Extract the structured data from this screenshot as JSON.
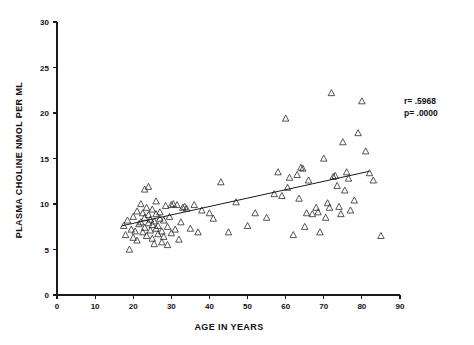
{
  "chart_data": {
    "type": "scatter",
    "title": "",
    "xlabel": "AGE IN YEARS",
    "ylabel": "PLASMA CHOLINE NMOL PER ML",
    "xlim": [
      0,
      90
    ],
    "ylim": [
      0,
      30
    ],
    "xticks": [
      0,
      10,
      20,
      30,
      40,
      50,
      60,
      70,
      80,
      90
    ],
    "yticks": [
      0,
      5,
      10,
      15,
      20,
      25,
      30
    ],
    "xtick_labels": [
      "0",
      "10",
      "20",
      "30",
      "40",
      "50",
      "60",
      "70",
      "80",
      "90"
    ],
    "ytick_labels": [
      "0",
      "5",
      "10",
      "15",
      "20",
      "25",
      "30"
    ],
    "grid": false,
    "legend": null,
    "marker": "triangle-up-open",
    "annotations": [
      {
        "name": "correlation",
        "text": "r= .5968"
      },
      {
        "name": "p-value",
        "text": "p= .0000"
      }
    ],
    "regression_line": {
      "x": [
        17,
        82
      ],
      "y": [
        7.6,
        13.6
      ],
      "slope": 0.0923,
      "intercept": 6.03
    },
    "points": [
      [
        17.5,
        7.6
      ],
      [
        18.0,
        6.6
      ],
      [
        18.5,
        8.2
      ],
      [
        19.0,
        5.0
      ],
      [
        19.5,
        7.2
      ],
      [
        20.0,
        6.3
      ],
      [
        20.0,
        8.6
      ],
      [
        20.5,
        7.0
      ],
      [
        21.0,
        9.2
      ],
      [
        21.0,
        6.0
      ],
      [
        21.5,
        7.8
      ],
      [
        22.0,
        8.0
      ],
      [
        22.0,
        10.0
      ],
      [
        22.5,
        6.9
      ],
      [
        22.5,
        9.0
      ],
      [
        23.0,
        7.4
      ],
      [
        23.0,
        8.5
      ],
      [
        23.0,
        11.6
      ],
      [
        23.5,
        6.5
      ],
      [
        23.5,
        9.6
      ],
      [
        24.0,
        7.9
      ],
      [
        24.0,
        8.8
      ],
      [
        24.0,
        11.9
      ],
      [
        24.5,
        7.1
      ],
      [
        24.5,
        8.3
      ],
      [
        25.0,
        6.2
      ],
      [
        25.0,
        7.7
      ],
      [
        25.0,
        9.4
      ],
      [
        25.5,
        8.1
      ],
      [
        25.5,
        5.6
      ],
      [
        26.0,
        7.3
      ],
      [
        26.0,
        8.9
      ],
      [
        26.0,
        10.3
      ],
      [
        26.5,
        6.7
      ],
      [
        26.5,
        7.6
      ],
      [
        27.0,
        8.4
      ],
      [
        27.0,
        9.1
      ],
      [
        27.5,
        5.8
      ],
      [
        27.5,
        7.0
      ],
      [
        28.0,
        8.2
      ],
      [
        28.0,
        6.4
      ],
      [
        28.5,
        9.8
      ],
      [
        29.0,
        7.5
      ],
      [
        29.0,
        5.5
      ],
      [
        29.5,
        8.6
      ],
      [
        30.0,
        6.8
      ],
      [
        30.0,
        9.9
      ],
      [
        30.5,
        10.0
      ],
      [
        31.0,
        7.2
      ],
      [
        31.5,
        9.9
      ],
      [
        32.0,
        6.1
      ],
      [
        32.5,
        8.0
      ],
      [
        33.0,
        9.6
      ],
      [
        33.5,
        9.7
      ],
      [
        34.0,
        9.5
      ],
      [
        35.0,
        7.3
      ],
      [
        36.0,
        9.9
      ],
      [
        37.0,
        6.9
      ],
      [
        38.0,
        9.3
      ],
      [
        40.0,
        9.0
      ],
      [
        41.0,
        8.4
      ],
      [
        43.0,
        12.4
      ],
      [
        45.0,
        6.9
      ],
      [
        47.0,
        10.2
      ],
      [
        50.0,
        7.6
      ],
      [
        52.0,
        9.0
      ],
      [
        55.0,
        8.5
      ],
      [
        57.0,
        11.1
      ],
      [
        58.0,
        13.5
      ],
      [
        59.0,
        10.9
      ],
      [
        60.0,
        19.4
      ],
      [
        60.5,
        11.8
      ],
      [
        61.0,
        12.9
      ],
      [
        62.0,
        6.6
      ],
      [
        63.0,
        13.2
      ],
      [
        63.5,
        10.6
      ],
      [
        64.0,
        14.0
      ],
      [
        64.5,
        13.9
      ],
      [
        65.0,
        7.5
      ],
      [
        65.5,
        9.0
      ],
      [
        66.0,
        12.6
      ],
      [
        67.0,
        8.9
      ],
      [
        68.0,
        9.6
      ],
      [
        68.5,
        9.1
      ],
      [
        69.0,
        6.9
      ],
      [
        70.0,
        15.0
      ],
      [
        70.5,
        8.5
      ],
      [
        71.0,
        10.1
      ],
      [
        71.5,
        9.6
      ],
      [
        72.0,
        22.2
      ],
      [
        72.5,
        13.0
      ],
      [
        73.0,
        13.1
      ],
      [
        73.5,
        12.0
      ],
      [
        74.0,
        9.7
      ],
      [
        74.5,
        8.9
      ],
      [
        75.0,
        16.8
      ],
      [
        75.5,
        11.5
      ],
      [
        76.0,
        13.5
      ],
      [
        76.5,
        12.8
      ],
      [
        77.0,
        9.3
      ],
      [
        78.0,
        10.4
      ],
      [
        79.0,
        17.8
      ],
      [
        80.0,
        21.3
      ],
      [
        81.0,
        15.8
      ],
      [
        82.0,
        13.4
      ],
      [
        83.0,
        12.6
      ],
      [
        85.0,
        6.5
      ]
    ]
  },
  "axes": {
    "x_title": "AGE IN YEARS",
    "y_title": "PLASMA CHOLINE NMOL PER ML"
  },
  "stats": {
    "r_label": "r= .5968",
    "p_label": "p= .0000"
  }
}
